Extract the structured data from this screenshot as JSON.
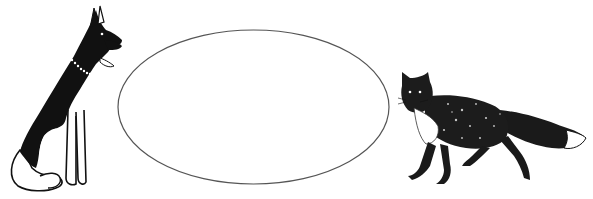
{
  "scene": {
    "background": "#ffffff",
    "figures": [
      {
        "id": "dog",
        "label": "German shepherd dog sitting, facing right",
        "position": "left"
      },
      {
        "id": "ellipse",
        "label": "empty oval",
        "position": "center"
      },
      {
        "id": "fox",
        "label": "fox walking, facing left",
        "position": "right"
      }
    ],
    "ellipse": {
      "cx": 253.5,
      "cy": 107,
      "rx": 135.5,
      "ry": 77,
      "stroke": "#555555"
    },
    "ink_color": "#111111"
  }
}
